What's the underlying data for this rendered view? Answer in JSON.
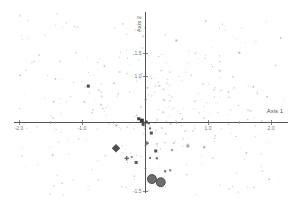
{
  "chart_data": {
    "type": "scatter",
    "title": "",
    "xlabel": "Axis 1",
    "ylabel": "Axis 2",
    "xlim": [
      -2.2,
      2.3
    ],
    "ylim": [
      -1.9,
      2.4
    ],
    "grid": false,
    "legend": null,
    "axis_colors": {
      "line": "#555555",
      "tick_label": "#777777",
      "axis_label": "#555555"
    },
    "x_ticks": [
      {
        "value": -2.0,
        "label": "-2.0"
      },
      {
        "value": -1.5,
        "label": ""
      },
      {
        "value": -1.0,
        "label": "-1.0"
      },
      {
        "value": -0.5,
        "label": ""
      },
      {
        "value": 0.5,
        "label": ""
      },
      {
        "value": 1.0,
        "label": "1.0"
      },
      {
        "value": 1.5,
        "label": ""
      },
      {
        "value": 2.0,
        "label": "2.0"
      }
    ],
    "y_ticks": [
      {
        "value": 1.5,
        "label": "1.5"
      },
      {
        "value": 1.0,
        "label": "1.0"
      },
      {
        "value": 0.5,
        "label": ""
      },
      {
        "value": -0.5,
        "label": ""
      },
      {
        "value": -1.0,
        "label": ""
      },
      {
        "value": -1.5,
        "label": "-1.5"
      }
    ],
    "series": [
      {
        "name": "emphasized-points",
        "points": [
          {
            "x": -0.9,
            "y": 0.78,
            "size": 3,
            "shape": "square",
            "color": "#4a4a4a"
          },
          {
            "x": -0.1,
            "y": 0.07,
            "size": 3,
            "shape": "square",
            "color": "#3f3f3f"
          },
          {
            "x": -0.05,
            "y": 0.03,
            "size": 4,
            "shape": "square",
            "color": "#383838"
          },
          {
            "x": 0.02,
            "y": 0.0,
            "size": 3,
            "shape": "square",
            "color": "#444444"
          },
          {
            "x": -0.03,
            "y": -0.05,
            "size": 3,
            "shape": "square",
            "color": "#4a4a4a"
          },
          {
            "x": 0.06,
            "y": -0.03,
            "size": 2,
            "shape": "square",
            "color": "#555555"
          },
          {
            "x": 0.08,
            "y": -0.14,
            "size": 2,
            "shape": "square",
            "color": "#6a6a6a"
          },
          {
            "x": -0.46,
            "y": -0.57,
            "size": 6,
            "shape": "diamond",
            "color": "#4f4f4f"
          },
          {
            "x": -0.29,
            "y": -0.79,
            "size": 4.5,
            "shape": "plus",
            "color": "#6a6a6a"
          },
          {
            "x": -0.21,
            "y": -0.76,
            "size": 2,
            "shape": "square",
            "color": "#8f8f8f"
          },
          {
            "x": -0.14,
            "y": -0.88,
            "size": 3,
            "shape": "square",
            "color": "#5a5a5a"
          },
          {
            "x": 0.1,
            "y": -0.24,
            "size": 3,
            "shape": "square",
            "color": "#555555"
          },
          {
            "x": 0.03,
            "y": -0.46,
            "size": 4,
            "shape": "plus",
            "color": "#666666"
          },
          {
            "x": 0.17,
            "y": -0.63,
            "size": 3,
            "shape": "square",
            "color": "#555555"
          },
          {
            "x": 0.08,
            "y": -0.78,
            "size": 2,
            "shape": "square",
            "color": "#777777"
          },
          {
            "x": 0.19,
            "y": -0.79,
            "size": 2,
            "shape": "square",
            "color": "#6f6f6f"
          },
          {
            "x": 0.32,
            "y": -1.07,
            "size": 2,
            "shape": "square",
            "color": "#5f5f5f"
          },
          {
            "x": 0.4,
            "y": -1.05,
            "size": 2,
            "shape": "square",
            "color": "#7a7a7a"
          },
          {
            "x": 0.43,
            "y": -0.61,
            "size": 2,
            "shape": "square",
            "color": "#9a9a9a"
          },
          {
            "x": 0.68,
            "y": -0.52,
            "size": 3,
            "shape": "square",
            "color": "#a8a8a8"
          },
          {
            "x": 0.94,
            "y": -0.55,
            "size": 2,
            "shape": "square",
            "color": "#9f9f9f"
          }
        ]
      },
      {
        "name": "highlight-cluster",
        "marker": "circle",
        "fill": "#6e6e6e",
        "stroke": "#3a3a3a",
        "points": [
          {
            "x": 0.11,
            "y": -1.24,
            "r": 4.5
          },
          {
            "x": 0.25,
            "y": -1.31,
            "r": 4.5
          }
        ]
      },
      {
        "name": "background-cloud",
        "count": 340,
        "seed": 11,
        "x_range": [
          -2.0,
          2.2
        ],
        "y_range": [
          -1.65,
          2.35
        ],
        "colors": [
          "#d3d3d3",
          "#dadada",
          "#e0e0e0",
          "#e6e6e6",
          "#cfcfcf",
          "#b9b9b9"
        ]
      }
    ]
  }
}
